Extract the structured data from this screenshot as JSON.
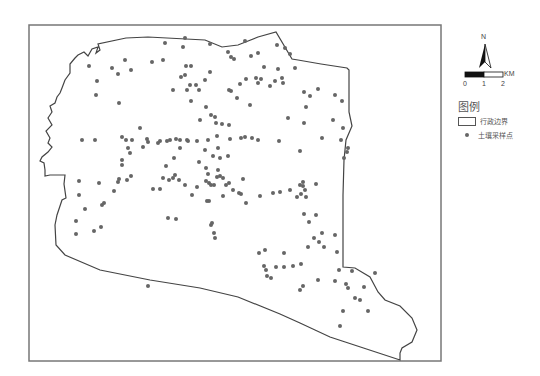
{
  "map": {
    "frame": {
      "x": 29,
      "y": 25,
      "width": 412,
      "height": 336,
      "stroke": "#777777"
    },
    "boundary_color": "#444444",
    "point_color": "#666666",
    "boundary_path": "M75,58 L78,55 L84,52 L88,56 L92,49 L98,47 L96,53 L100,50 L98,44 L126,38 L148,37 L205,40 L222,47 L238,45 L258,37 L276,32 L292,59 L298,60 L321,64 L347,68 L349,70 L349,112 L352,126 L346,140 L344,160 L343,195 L343,267 L355,268 L370,277 L378,292 L385,300 L400,306 L412,318 L417,330 L412,342 L402,348 L400,353 L400,360 L330,337 L300,323 L280,314 L238,297 L200,288 L150,280 L100,270 L65,255 L56,245 L55,225 L57,215 L60,206 L62,200 L66,198 L64,184 L65,175 L50,175 L45,176 L45,170 L44,163 L40,161 L42,157 L48,152 L52,147 L48,143 L50,138 L46,131 L52,125 L48,118 L52,112 L50,106 L55,103 L57,97 L60,93 L62,88 L65,80 L70,73 L70,64 Z",
    "sample_points": [
      [
        125,
        60
      ],
      [
        89,
        66
      ],
      [
        112,
        68
      ],
      [
        97,
        81
      ],
      [
        118,
        74
      ],
      [
        131,
        70
      ],
      [
        152,
        62
      ],
      [
        165,
        43
      ],
      [
        163,
        60
      ],
      [
        183,
        47
      ],
      [
        186,
        66
      ],
      [
        181,
        77
      ],
      [
        185,
        75
      ],
      [
        191,
        66
      ],
      [
        185,
        38
      ],
      [
        210,
        44
      ],
      [
        228,
        52
      ],
      [
        231,
        57
      ],
      [
        234,
        59
      ],
      [
        251,
        56
      ],
      [
        258,
        53
      ],
      [
        245,
        41
      ],
      [
        277,
        45
      ],
      [
        285,
        48
      ],
      [
        290,
        54
      ],
      [
        264,
        67
      ],
      [
        278,
        69
      ],
      [
        295,
        68
      ],
      [
        282,
        78
      ],
      [
        258,
        83
      ],
      [
        205,
        80
      ],
      [
        210,
        72
      ],
      [
        173,
        90
      ],
      [
        187,
        90
      ],
      [
        190,
        85
      ],
      [
        199,
        90
      ],
      [
        237,
        98
      ],
      [
        211,
        115
      ],
      [
        216,
        123
      ],
      [
        222,
        124
      ],
      [
        229,
        125
      ],
      [
        231,
        91
      ],
      [
        270,
        86
      ],
      [
        306,
        107
      ],
      [
        310,
        96
      ],
      [
        288,
        118
      ],
      [
        304,
        123
      ],
      [
        333,
        120
      ],
      [
        348,
        148
      ],
      [
        322,
        138
      ],
      [
        300,
        151
      ],
      [
        279,
        141
      ],
      [
        196,
        85
      ],
      [
        191,
        101
      ],
      [
        206,
        107
      ],
      [
        215,
        117
      ],
      [
        229,
        90
      ],
      [
        250,
        105
      ],
      [
        240,
        84
      ],
      [
        246,
        79
      ],
      [
        256,
        78
      ],
      [
        261,
        79
      ],
      [
        275,
        81
      ],
      [
        283,
        83
      ],
      [
        304,
        92
      ],
      [
        318,
        89
      ],
      [
        335,
        95
      ],
      [
        342,
        101
      ],
      [
        96,
        95
      ],
      [
        119,
        103
      ],
      [
        200,
        120
      ],
      [
        82,
        140
      ],
      [
        95,
        140
      ],
      [
        122,
        137
      ],
      [
        126,
        140
      ],
      [
        132,
        140
      ],
      [
        147,
        139
      ],
      [
        160,
        141
      ],
      [
        170,
        140
      ],
      [
        176,
        139
      ],
      [
        180,
        140
      ],
      [
        187,
        140
      ],
      [
        197,
        141
      ],
      [
        208,
        140
      ],
      [
        217,
        136
      ],
      [
        230,
        139
      ],
      [
        241,
        138
      ],
      [
        245,
        137
      ],
      [
        252,
        138
      ],
      [
        258,
        140
      ],
      [
        140,
        128
      ],
      [
        128,
        148
      ],
      [
        130,
        153
      ],
      [
        122,
        160
      ],
      [
        122,
        165
      ],
      [
        158,
        143
      ],
      [
        167,
        141
      ],
      [
        180,
        148
      ],
      [
        188,
        141
      ],
      [
        205,
        150
      ],
      [
        218,
        148
      ],
      [
        213,
        156
      ],
      [
        220,
        158
      ],
      [
        228,
        156
      ],
      [
        148,
        142
      ],
      [
        143,
        147
      ],
      [
        199,
        162
      ],
      [
        206,
        168
      ],
      [
        208,
        174
      ],
      [
        217,
        177
      ],
      [
        220,
        176
      ],
      [
        223,
        178
      ],
      [
        218,
        170
      ],
      [
        226,
        185
      ],
      [
        229,
        183
      ],
      [
        233,
        190
      ],
      [
        239,
        193
      ],
      [
        206,
        181
      ],
      [
        209,
        183
      ],
      [
        211,
        185
      ],
      [
        214,
        185
      ],
      [
        223,
        196
      ],
      [
        166,
        166
      ],
      [
        174,
        158
      ],
      [
        175,
        175
      ],
      [
        179,
        180
      ],
      [
        185,
        185
      ],
      [
        163,
        178
      ],
      [
        169,
        180
      ],
      [
        173,
        178
      ],
      [
        160,
        189
      ],
      [
        192,
        195
      ],
      [
        209,
        201
      ],
      [
        243,
        179
      ],
      [
        241,
        194
      ],
      [
        99,
        183
      ],
      [
        79,
        181
      ],
      [
        79,
        195
      ],
      [
        85,
        209
      ],
      [
        102,
        205
      ],
      [
        104,
        203
      ],
      [
        118,
        182
      ],
      [
        127,
        180
      ],
      [
        131,
        176
      ],
      [
        114,
        191
      ],
      [
        119,
        179
      ],
      [
        153,
        189
      ],
      [
        197,
        187
      ],
      [
        207,
        201
      ],
      [
        211,
        225
      ],
      [
        212,
        223
      ],
      [
        168,
        218
      ],
      [
        176,
        219
      ],
      [
        214,
        233
      ],
      [
        215,
        238
      ],
      [
        260,
        196
      ],
      [
        273,
        193
      ],
      [
        280,
        192
      ],
      [
        246,
        203
      ],
      [
        290,
        190
      ],
      [
        300,
        185
      ],
      [
        303,
        186
      ],
      [
        297,
        197
      ],
      [
        306,
        197
      ],
      [
        305,
        190
      ],
      [
        301,
        194
      ],
      [
        303,
        182
      ],
      [
        316,
        184
      ],
      [
        309,
        222
      ],
      [
        314,
        238
      ],
      [
        304,
        214
      ],
      [
        316,
        215
      ],
      [
        322,
        233
      ],
      [
        324,
        247
      ],
      [
        284,
        253
      ],
      [
        308,
        247
      ],
      [
        319,
        242
      ],
      [
        335,
        235
      ],
      [
        337,
        252
      ],
      [
        265,
        250
      ],
      [
        259,
        253
      ],
      [
        264,
        266
      ],
      [
        266,
        270
      ],
      [
        267,
        276
      ],
      [
        276,
        267
      ],
      [
        284,
        267
      ],
      [
        293,
        266
      ],
      [
        301,
        264
      ],
      [
        271,
        278
      ],
      [
        335,
        281
      ],
      [
        339,
        270
      ],
      [
        352,
        271
      ],
      [
        375,
        273
      ],
      [
        346,
        284
      ],
      [
        355,
        298
      ],
      [
        364,
        287
      ],
      [
        360,
        300
      ],
      [
        368,
        311
      ],
      [
        318,
        280
      ],
      [
        300,
        290
      ],
      [
        303,
        286
      ],
      [
        343,
        311
      ],
      [
        340,
        326
      ],
      [
        348,
        288
      ],
      [
        148,
        286
      ],
      [
        76,
        234
      ],
      [
        94,
        231
      ],
      [
        101,
        227
      ],
      [
        343,
        128
      ],
      [
        341,
        140
      ],
      [
        347,
        152
      ],
      [
        344,
        158
      ],
      [
        76,
        221
      ]
    ]
  },
  "north_arrow": {
    "label": "N"
  },
  "scale_bar": {
    "unit": "KM",
    "ticks": [
      "0",
      "1",
      "2"
    ]
  },
  "legend": {
    "title": "图例",
    "items": [
      {
        "label": "行政边界",
        "symbol": "boundary-box"
      },
      {
        "label": "土壤采样点",
        "symbol": "point-dot"
      }
    ]
  }
}
